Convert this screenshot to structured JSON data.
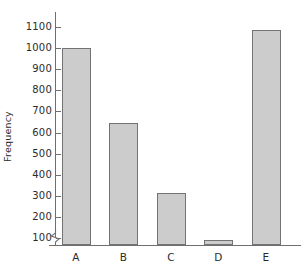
{
  "chart_data": {
    "type": "bar",
    "title": "",
    "subtitle": "",
    "xlabel": "",
    "ylabel": "Frequency",
    "categories": [
      "A",
      "B",
      "C",
      "D",
      "E"
    ],
    "values": [
      1000,
      645,
      315,
      90,
      1085
    ],
    "series": [
      {
        "name": "Frequency",
        "values": [
          1000,
          645,
          315,
          90,
          1085
        ]
      }
    ],
    "ylim": [
      0,
      1150
    ],
    "y_ticks": [
      100,
      200,
      300,
      400,
      500,
      600,
      700,
      800,
      900,
      1000,
      1100
    ],
    "y_tick_labels": [
      "100",
      "200",
      "300",
      "400",
      "500",
      "600",
      "700",
      "800",
      "900",
      "1000",
      "1100"
    ],
    "grid": false,
    "legend": false,
    "legend_position": "none",
    "axis_break": true,
    "axis_break_note": "zigzag break on y-axis below the 100 tick",
    "bar_fill_color": "#cccccc",
    "bar_edge_color": "#737373",
    "axis_color": "#6f6f6f",
    "text_color": "#2b2b2b",
    "background_color": "#ffffff",
    "annotations": []
  },
  "axes": {
    "y_title": "Frequency"
  }
}
